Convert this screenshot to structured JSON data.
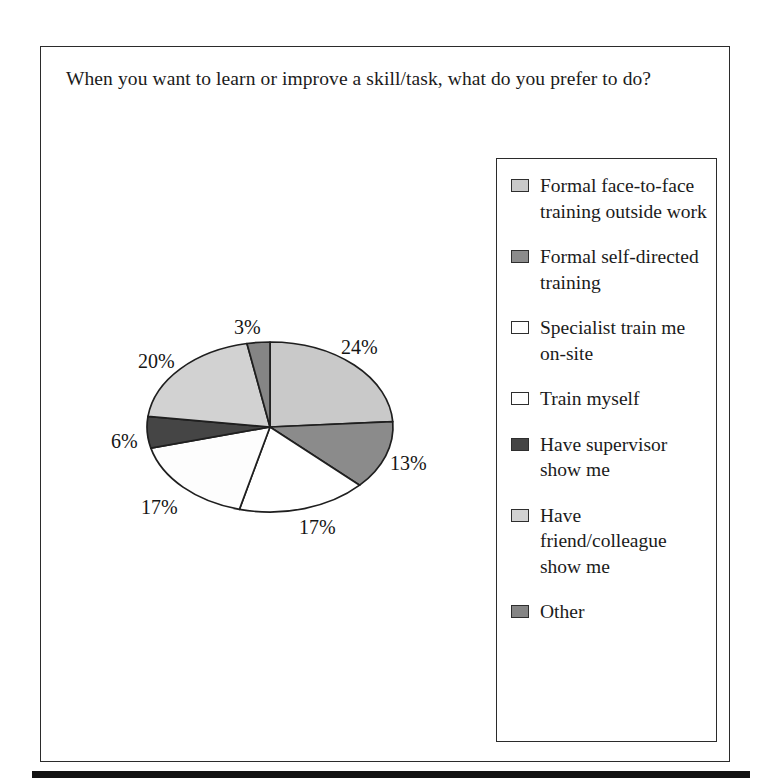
{
  "figure": {
    "title": "When you want to learn or improve a skill/task, what do you prefer to do?"
  },
  "chart_data": {
    "type": "pie",
    "title": "When you want to learn or improve a skill/task, what do you prefer to do?",
    "xlabel": "",
    "ylabel": "",
    "legend_position": "right",
    "grid": false,
    "value_suffix": "%",
    "start_angle_deg": 0,
    "direction": "clockwise",
    "categories": [
      "Formal face-to-face training outside work",
      "Formal self-directed training",
      "Specialist train me on-site",
      "Train myself",
      "Have supervisor show me",
      "Have friend/colleague show me",
      "Other"
    ],
    "values": [
      24,
      13,
      17,
      17,
      6,
      20,
      3
    ],
    "labels": [
      "24%",
      "13%",
      "17%",
      "17%",
      "6%",
      "20%",
      "3%"
    ],
    "colors": [
      "#c9c9c9",
      "#8b8b8b",
      "#ffffff",
      "#fdfdfd",
      "#454545",
      "#d2d2d2",
      "#858585"
    ],
    "slice_edge_color": "#1f1f1f"
  },
  "pie_labels": [
    {
      "text": "3%",
      "left": 234,
      "top": 316
    },
    {
      "text": "24%",
      "left": 341,
      "top": 336
    },
    {
      "text": "13%",
      "left": 390,
      "top": 452
    },
    {
      "text": "17%",
      "left": 299,
      "top": 516
    },
    {
      "text": "17%",
      "left": 141,
      "top": 496
    },
    {
      "text": "6%",
      "left": 111,
      "top": 430
    },
    {
      "text": "20%",
      "left": 138,
      "top": 350
    }
  ],
  "legend": {
    "items": [
      {
        "label": "Formal face-to-face training outside work",
        "color": "#c9c9c9",
        "name": "legend-item-formal-face-to-face"
      },
      {
        "label": "Formal self-directed training",
        "color": "#8b8b8b",
        "name": "legend-item-formal-self-directed"
      },
      {
        "label": "Specialist train me on-site",
        "color": "#ffffff",
        "name": "legend-item-specialist-on-site"
      },
      {
        "label": "Train myself",
        "color": "#ffffff",
        "name": "legend-item-train-myself"
      },
      {
        "label": "Have supervisor show me",
        "color": "#454545",
        "name": "legend-item-supervisor-show-me"
      },
      {
        "label": "Have friend/colleague show me",
        "color": "#d2d2d2",
        "name": "legend-item-friend-colleague"
      },
      {
        "label": "Other",
        "color": "#858585",
        "name": "legend-item-other"
      }
    ]
  }
}
